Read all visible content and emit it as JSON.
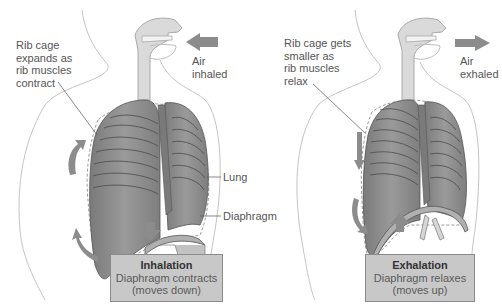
{
  "colors": {
    "lung_fill": "#8c8c8c",
    "lung_dark": "#6f6f6f",
    "arrow": "#8e8e8e",
    "airway": "#d9d9d9",
    "outline": "#b5b5b5",
    "box_fill": "#c8c8c8"
  },
  "panels": [
    {
      "id": "inhalation",
      "rib_label": "Rib cage\nexpands as\nrib muscles\ncontract",
      "air_label": "Air\ninhaled",
      "air_direction": "in",
      "diaphragm_direction": "down",
      "caption_title": "Inhalation",
      "caption_line1": "Diaphragm contracts",
      "caption_line2": "(moves down)",
      "callouts": [
        "Lung",
        "Diaphragm"
      ]
    },
    {
      "id": "exhalation",
      "rib_label": "Rib cage gets\nsmaller as\nrib muscles\nrelax",
      "air_label": "Air\nexhaled",
      "air_direction": "out",
      "diaphragm_direction": "up",
      "caption_title": "Exhalation",
      "caption_line1": "Diaphragm relaxes",
      "caption_line2": "(moves up)"
    }
  ]
}
